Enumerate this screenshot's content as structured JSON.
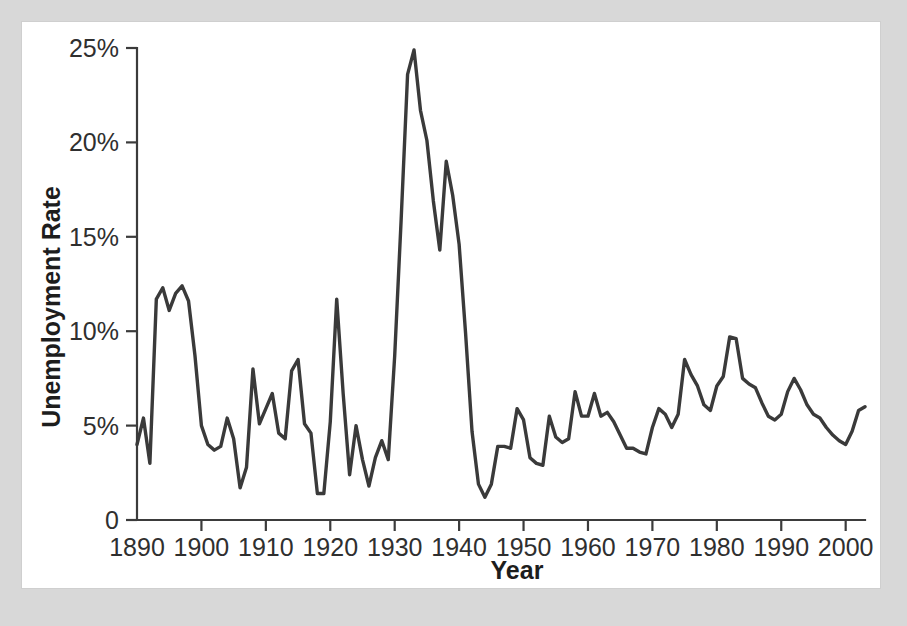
{
  "figure": {
    "background_color": "#d8d8d8",
    "panel_color": "#ffffff",
    "line_color": "#3a3a3a",
    "axis_color": "#3b3b3b"
  },
  "axes": {
    "y_title": "Unemployment Rate",
    "x_title": "Year",
    "y_ticks": [
      "0",
      "5%",
      "10%",
      "15%",
      "20%",
      "25%"
    ],
    "x_ticks": [
      "1890",
      "1900",
      "1910",
      "1920",
      "1930",
      "1940",
      "1950",
      "1960",
      "1970",
      "1980",
      "1990",
      "2000"
    ]
  },
  "chart_data": {
    "type": "line",
    "title": "",
    "subtitle": "",
    "xlabel": "Year",
    "ylabel": "Unemployment Rate",
    "xlim": [
      1890,
      2003
    ],
    "ylim": [
      0,
      25
    ],
    "grid": false,
    "legend": false,
    "y_tick_values": [
      0,
      5,
      10,
      15,
      20,
      25
    ],
    "y_tick_labels": [
      "0",
      "5%",
      "10%",
      "15%",
      "20%",
      "25%"
    ],
    "x_tick_values": [
      1890,
      1900,
      1910,
      1920,
      1930,
      1940,
      1950,
      1960,
      1970,
      1980,
      1990,
      2000
    ],
    "x_tick_labels": [
      "1890",
      "1900",
      "1910",
      "1920",
      "1930",
      "1940",
      "1950",
      "1960",
      "1970",
      "1980",
      "1990",
      "2000"
    ],
    "series": [
      {
        "name": "Unemployment Rate",
        "color": "#3a3a3a",
        "x": [
          1890,
          1891,
          1892,
          1893,
          1894,
          1895,
          1896,
          1897,
          1898,
          1899,
          1900,
          1901,
          1902,
          1903,
          1904,
          1905,
          1906,
          1907,
          1908,
          1909,
          1910,
          1911,
          1912,
          1913,
          1914,
          1915,
          1916,
          1917,
          1918,
          1919,
          1920,
          1921,
          1922,
          1923,
          1924,
          1925,
          1926,
          1927,
          1928,
          1929,
          1930,
          1931,
          1932,
          1933,
          1934,
          1935,
          1936,
          1937,
          1938,
          1939,
          1940,
          1941,
          1942,
          1943,
          1944,
          1945,
          1946,
          1947,
          1948,
          1949,
          1950,
          1951,
          1952,
          1953,
          1954,
          1955,
          1956,
          1957,
          1958,
          1959,
          1960,
          1961,
          1962,
          1963,
          1964,
          1965,
          1966,
          1967,
          1968,
          1969,
          1970,
          1971,
          1972,
          1973,
          1974,
          1975,
          1976,
          1977,
          1978,
          1979,
          1980,
          1981,
          1982,
          1983,
          1984,
          1985,
          1986,
          1987,
          1988,
          1989,
          1990,
          1991,
          1992,
          1993,
          1994,
          1995,
          1996,
          1997,
          1998,
          1999,
          2000,
          2001,
          2002,
          2003
        ],
        "y": [
          4.0,
          5.4,
          3.0,
          11.7,
          12.3,
          11.1,
          12.0,
          12.4,
          11.6,
          8.7,
          5.0,
          4.0,
          3.7,
          3.9,
          5.4,
          4.3,
          1.7,
          2.8,
          8.0,
          5.1,
          5.9,
          6.7,
          4.6,
          4.3,
          7.9,
          8.5,
          5.1,
          4.6,
          1.4,
          1.4,
          5.2,
          11.7,
          6.7,
          2.4,
          5.0,
          3.2,
          1.8,
          3.3,
          4.2,
          3.2,
          8.7,
          15.9,
          23.6,
          24.9,
          21.7,
          20.1,
          16.9,
          14.3,
          19.0,
          17.2,
          14.6,
          9.9,
          4.7,
          1.9,
          1.2,
          1.9,
          3.9,
          3.9,
          3.8,
          5.9,
          5.3,
          3.3,
          3.0,
          2.9,
          5.5,
          4.4,
          4.1,
          4.3,
          6.8,
          5.5,
          5.5,
          6.7,
          5.5,
          5.7,
          5.2,
          4.5,
          3.8,
          3.8,
          3.6,
          3.5,
          4.9,
          5.9,
          5.6,
          4.9,
          5.6,
          8.5,
          7.7,
          7.1,
          6.1,
          5.8,
          7.1,
          7.6,
          9.7,
          9.6,
          7.5,
          7.2,
          7.0,
          6.2,
          5.5,
          5.3,
          5.6,
          6.8,
          7.5,
          6.9,
          6.1,
          5.6,
          5.4,
          4.9,
          4.5,
          4.2,
          4.0,
          4.7,
          5.8,
          6.0
        ]
      }
    ]
  }
}
